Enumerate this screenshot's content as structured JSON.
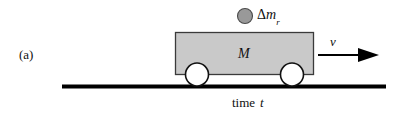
{
  "figure": {
    "panel_label": "(a)",
    "caption": "time t",
    "caption_word": "time",
    "caption_var": "t",
    "cart": {
      "mass_label": "M",
      "body_fill": "#c9c9c9",
      "body_stroke": "#3a3a3a",
      "wheel_fill": "#ffffff",
      "wheel_stroke": "#111111"
    },
    "droplet": {
      "label_delta": "Δ",
      "label_var": "m",
      "label_sub": "r",
      "full_label": "Δm_r",
      "fill": "#999999",
      "stroke": "#4a4a4a"
    },
    "velocity": {
      "label": "v",
      "direction": "right"
    },
    "ground": {
      "color": "#000000"
    }
  }
}
